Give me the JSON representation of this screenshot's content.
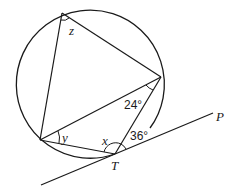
{
  "diagram": {
    "type": "circle-geometry",
    "labels": {
      "angle_z": "z",
      "angle_y": "y",
      "angle_x": "x",
      "angle_24": "24°",
      "angle_36": "36°",
      "point_T": "T",
      "point_P": "P"
    },
    "colors": {
      "stroke": "#1a1a1a",
      "background": "#ffffff"
    }
  }
}
